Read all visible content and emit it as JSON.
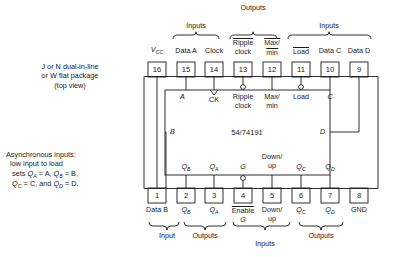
{
  "diagram": {
    "chip_name": "54/74191",
    "package_note": "J or N dual-in-line\nor W flat package\n(top view)",
    "async_note_line1": "Asynchronous inputs:",
    "async_note_line2": "low input to load",
    "async_note_line3": "sets Q",
    "async_note_line3b": "A",
    "async_note_line3c": " = A, Q",
    "async_note_line3d": "B",
    "async_note_line3e": " = B,",
    "async_note_line4": "Q",
    "async_note_line4b": "C",
    "async_note_line4c": " = C, and Q",
    "async_note_line4d": "D",
    "async_note_line4e": " = D."
  },
  "top_group_labels": [
    {
      "text": "Inputs",
      "x": 196,
      "y": 29
    },
    {
      "text": "Outputs",
      "x": 253,
      "y": 11
    },
    {
      "text": "Inputs",
      "x": 329,
      "y": 29
    }
  ],
  "bottom_group_labels": [
    {
      "text": "Input",
      "x": 167,
      "y": 238
    },
    {
      "text": "Outputs",
      "x": 205,
      "y": 238
    },
    {
      "text": "Inputs",
      "x": 265,
      "y": 248
    },
    {
      "text": "Outputs",
      "x": 321,
      "y": 238
    }
  ],
  "top_pins": [
    {
      "num": "16",
      "x": 157,
      "label": "Vcc",
      "label_html": "vcc",
      "inner": "",
      "bubble": false,
      "clock": false
    },
    {
      "num": "15",
      "x": 186,
      "label": "Data A",
      "label_html": "plain",
      "inner": "A",
      "bubble": false,
      "clock": false
    },
    {
      "num": "14",
      "x": 214,
      "label": "Clock",
      "label_html": "plain",
      "inner": "CK",
      "bubble": false,
      "clock": true
    },
    {
      "num": "13",
      "x": 243,
      "label": "Ripple\nclock",
      "label_html": "ovl_first",
      "inner": "Ripple\nclock",
      "bubble": true,
      "clock": false
    },
    {
      "num": "12",
      "x": 272,
      "label": "Max/\nmin",
      "label_html": "ovl_both",
      "inner": "Max/\nmin",
      "bubble": false,
      "clock": false
    },
    {
      "num": "11",
      "x": 301,
      "label": "Load",
      "label_html": "ovl",
      "inner": "Load",
      "bubble": true,
      "clock": false
    },
    {
      "num": "10",
      "x": 330,
      "label": "Data C",
      "label_html": "plain",
      "inner": "C",
      "bubble": false,
      "clock": false
    },
    {
      "num": "9",
      "x": 359,
      "label": "Data D",
      "label_html": "plain",
      "inner": "D",
      "bubble": false,
      "clock": false
    }
  ],
  "bottom_pins": [
    {
      "num": "1",
      "x": 157,
      "label": "Data B",
      "label_html": "plain",
      "inner": "",
      "bubble": false
    },
    {
      "num": "2",
      "x": 186,
      "label": "QB",
      "label_html": "sub",
      "inner": "QB",
      "bubble": false
    },
    {
      "num": "3",
      "x": 214,
      "label": "QA",
      "label_html": "sub",
      "inner": "QA",
      "bubble": false
    },
    {
      "num": "4",
      "x": 243,
      "label": "Enable\nG",
      "label_html": "ovl_two",
      "inner": "G",
      "bubble": true
    },
    {
      "num": "5",
      "x": 272,
      "label": "Down/\nup",
      "label_html": "plain",
      "inner": "Down/\nup",
      "bubble": false
    },
    {
      "num": "6",
      "x": 301,
      "label": "QC",
      "label_html": "sub",
      "inner": "QC",
      "bubble": false
    },
    {
      "num": "7",
      "x": 330,
      "label": "QD",
      "label_html": "sub",
      "inner": "QD",
      "bubble": false
    },
    {
      "num": "8",
      "x": 359,
      "label": "GND",
      "label_html": "plain",
      "inner": "",
      "bubble": false
    }
  ],
  "side_labels": [
    {
      "text": "B",
      "x": 171,
      "y": 132
    },
    {
      "text": "D",
      "x": 325,
      "y": 132
    }
  ],
  "colors": {
    "ink": "#1a1a1a",
    "background": "#ffffff"
  }
}
